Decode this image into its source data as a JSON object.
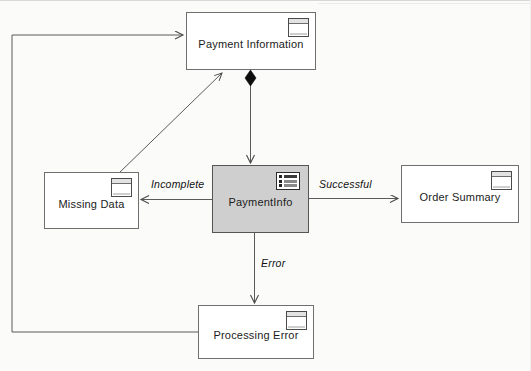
{
  "diagram": {
    "type": "uml-state-flow",
    "background_color": "#fbfbfa",
    "shaded_node_color": "#cfcfcf",
    "line_color": "#5a5a5a",
    "nodes": [
      {
        "id": "payment-information",
        "label": "Payment Information",
        "icon": "window-icon",
        "shaded": false,
        "x": 186,
        "y": 12,
        "w": 130,
        "h": 58
      },
      {
        "id": "missing-data",
        "label": "Missing Data",
        "icon": "window-icon",
        "shaded": false,
        "x": 44,
        "y": 172,
        "w": 95,
        "h": 57
      },
      {
        "id": "payment-info",
        "label": "PaymentInfo",
        "icon": "list-icon",
        "shaded": true,
        "x": 212,
        "y": 165,
        "w": 97,
        "h": 68
      },
      {
        "id": "order-summary",
        "label": "Order Summary",
        "icon": "window-icon",
        "shaded": false,
        "x": 401,
        "y": 165,
        "w": 118,
        "h": 58
      },
      {
        "id": "processing-error",
        "label": "Processing Error",
        "icon": "window-icon",
        "shaded": false,
        "x": 198,
        "y": 305,
        "w": 116,
        "h": 54
      }
    ],
    "edges": [
      {
        "id": "composition",
        "from": "payment-information",
        "to": "payment-info",
        "label": "",
        "marker_start": "filled-diamond",
        "marker_end": "open-arrow"
      },
      {
        "id": "incomplete",
        "from": "payment-info",
        "to": "missing-data",
        "label": "Incomplete",
        "marker_start": "none",
        "marker_end": "open-arrow"
      },
      {
        "id": "successful",
        "from": "payment-info",
        "to": "order-summary",
        "label": "Successful",
        "marker_start": "none",
        "marker_end": "open-arrow"
      },
      {
        "id": "error",
        "from": "payment-info",
        "to": "processing-error",
        "label": "Error",
        "marker_start": "none",
        "marker_end": "open-arrow"
      },
      {
        "id": "retry-loop",
        "from": "processing-error",
        "to": "payment-information",
        "label": "",
        "marker_start": "none",
        "marker_end": "open-arrow"
      },
      {
        "id": "resubmit",
        "from": "missing-data",
        "to": "payment-information",
        "label": "",
        "marker_start": "none",
        "marker_end": "open-arrow"
      }
    ],
    "edge_labels": {
      "incomplete": "Incomplete",
      "successful": "Successful",
      "error": "Error"
    }
  }
}
